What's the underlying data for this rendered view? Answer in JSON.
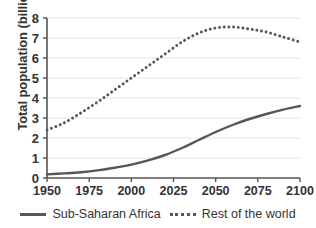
{
  "chart_data": {
    "type": "line",
    "title": "",
    "xlabel": "",
    "ylabel": "Total population (billions)",
    "xlim": [
      1950,
      2100
    ],
    "ylim": [
      0,
      8
    ],
    "grid": true,
    "legend_position": "bottom",
    "xticks": [
      "1950",
      "1975",
      "2000",
      "2025",
      "2050",
      "2075",
      "2100"
    ],
    "yticks": [
      "0",
      "1",
      "2",
      "3",
      "4",
      "5",
      "6",
      "7",
      "8"
    ],
    "x": [
      1950,
      1960,
      1970,
      1980,
      1990,
      2000,
      2010,
      2020,
      2030,
      2040,
      2050,
      2060,
      2070,
      2080,
      2090,
      2100
    ],
    "series": [
      {
        "name": "Sub-Saharan Africa",
        "style": "solid",
        "color": "#575757",
        "values": [
          0.18,
          0.23,
          0.29,
          0.38,
          0.51,
          0.67,
          0.88,
          1.15,
          1.5,
          1.9,
          2.3,
          2.65,
          2.95,
          3.2,
          3.42,
          3.6
        ]
      },
      {
        "name": "Rest of the world",
        "style": "dotted",
        "color": "#575757",
        "values": [
          2.4,
          2.75,
          3.25,
          3.8,
          4.4,
          5.0,
          5.6,
          6.2,
          6.8,
          7.25,
          7.5,
          7.55,
          7.45,
          7.3,
          7.05,
          6.8
        ]
      }
    ]
  },
  "legend": {
    "items": [
      {
        "label": "Sub-Saharan Africa",
        "marker": "solid-line-swatch"
      },
      {
        "label": "Rest of the world",
        "marker": "dotted-line-swatch"
      }
    ]
  }
}
